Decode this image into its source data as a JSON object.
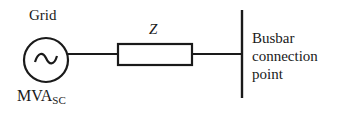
{
  "diagram": {
    "source": {
      "label": "Grid",
      "icon": "ac-source-icon",
      "rating_label": "MVA",
      "rating_subscript": "SC"
    },
    "impedance": {
      "label": "Z"
    },
    "busbar": {
      "label": "Busbar connection point"
    },
    "colors": {
      "stroke": "#1a1a1a",
      "background": "#ffffff"
    }
  }
}
